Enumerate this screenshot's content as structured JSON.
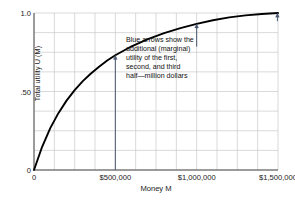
{
  "chart_data": {
    "type": "line",
    "title": "",
    "xlabel": "Money M",
    "ylabel": "Total utility U (M)",
    "xlim": [
      0,
      1500000
    ],
    "ylim": [
      0,
      1.0
    ],
    "grid": true,
    "legend": "none",
    "x_ticks": [
      {
        "value": 0,
        "label": "0"
      },
      {
        "value": 500000,
        "label": "$500,000"
      },
      {
        "value": 1000000,
        "label": "$1,000,000"
      },
      {
        "value": 1500000,
        "label": "$1,500,000"
      }
    ],
    "y_ticks": [
      {
        "value": 0,
        "label": "0"
      },
      {
        "value": 0.5,
        "label": ".50"
      },
      {
        "value": 1.0,
        "label": "1.0"
      }
    ],
    "grid_columns": 12,
    "grid_rows": 8,
    "series": [
      {
        "name": "Total utility U(M)",
        "color": "#000000",
        "x": [
          0,
          50000,
          100000,
          150000,
          200000,
          250000,
          300000,
          350000,
          400000,
          450000,
          500000,
          600000,
          700000,
          800000,
          900000,
          1000000,
          1100000,
          1200000,
          1300000,
          1400000,
          1500000
        ],
        "y": [
          0.0,
          0.148,
          0.267,
          0.362,
          0.442,
          0.509,
          0.566,
          0.615,
          0.658,
          0.697,
          0.731,
          0.788,
          0.834,
          0.872,
          0.904,
          0.931,
          0.954,
          0.972,
          0.985,
          0.994,
          1.0
        ]
      }
    ],
    "annotations": [
      {
        "name": "marginal-utility-note",
        "lines": [
          "Blue arrows show the",
          "additional (marginal)",
          "utility of the first,",
          "second, and third",
          "half—million dollars"
        ]
      }
    ],
    "arrows": [
      {
        "name": "first-half-million",
        "x": 500000,
        "y_start": 0.0,
        "y_end": 0.731,
        "color": "#4a5770"
      },
      {
        "name": "second-half-million",
        "x": 1000000,
        "y_start": 0.786,
        "y_end": 0.931,
        "color": "#4a5770"
      },
      {
        "name": "third-half-million",
        "x": 1500000,
        "y_start": 0.948,
        "y_end": 1.0,
        "color": "#4a5770"
      }
    ]
  },
  "style": {
    "grid_color": "#c8c8c8",
    "axis_color": "#3a3a3a",
    "curve_color": "#000000",
    "arrow_color": "#4a5770",
    "text_color": "#1a1a1a",
    "background": "#ffffff"
  }
}
